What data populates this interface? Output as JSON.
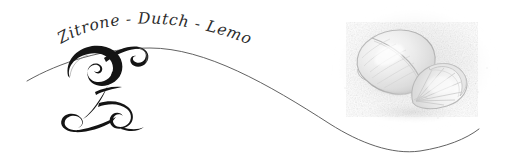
{
  "canvas": {
    "width": 506,
    "height": 168,
    "background_color": "#ffffff"
  },
  "wordmark": {
    "name": "zitrone-dutch-lemon-wordmark",
    "full_text": "Zitrone - Dutch - Lemon",
    "words": [
      {
        "text": "Zitrone"
      },
      {
        "text": "Dutch"
      },
      {
        "text": "Lemon"
      }
    ],
    "separator": "-",
    "style": "italic script, arched baseline",
    "color": "#2b2b2b"
  },
  "monogram": {
    "name": "letter-z-monogram",
    "letter": "Z",
    "style": "ornate calligraphic swash capital",
    "color": "#141414"
  },
  "swash": {
    "name": "sweeping-s-curve",
    "description": "long S-shaped flourish line sweeping across the full width",
    "color": "#5a5a5a"
  },
  "illustration": {
    "name": "lemon-illustration",
    "subject": "lemon with wedge slice",
    "style": "faint graphite pencil sketch",
    "parts": [
      {
        "name": "whole-lemon",
        "label": "lemon"
      },
      {
        "name": "lemon-wedge",
        "label": "wedge"
      }
    ],
    "tone_color": "#d8d8d8"
  }
}
